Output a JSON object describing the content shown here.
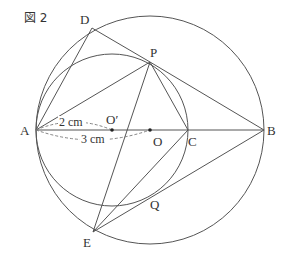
{
  "figure": {
    "title": "図 2",
    "points": {
      "A": {
        "label": "A",
        "x": 36,
        "y": 130
      },
      "B": {
        "label": "B",
        "x": 264,
        "y": 130
      },
      "C": {
        "label": "C",
        "x": 188,
        "y": 130
      },
      "O": {
        "label": "O",
        "x": 150,
        "y": 130
      },
      "O_prime": {
        "label": "O′",
        "x": 112,
        "y": 130
      },
      "D": {
        "label": "D",
        "x": 92,
        "y": 28
      },
      "P": {
        "label": "P",
        "x": 150,
        "y": 62
      },
      "E": {
        "label": "E",
        "x": 93,
        "y": 232
      },
      "Q": {
        "label": "Q",
        "x": 158,
        "y": 193
      }
    },
    "circles": [
      {
        "name": "large-circle",
        "center": "O",
        "radius": 114
      },
      {
        "name": "small-circle",
        "center": "O_prime",
        "radius": 76
      }
    ],
    "segments": [
      [
        "A",
        "B"
      ],
      [
        "A",
        "D"
      ],
      [
        "D",
        "P"
      ],
      [
        "A",
        "P"
      ],
      [
        "P",
        "B"
      ],
      [
        "P",
        "C"
      ],
      [
        "P",
        "E"
      ],
      [
        "E",
        "C"
      ],
      [
        "E",
        "B"
      ]
    ],
    "dimensions": [
      {
        "label": "2 cm",
        "from": "A",
        "to": "O_prime"
      },
      {
        "label": "3 cm",
        "from": "A",
        "to": "O"
      }
    ],
    "colors": {
      "line": "#555555",
      "text": "#333333",
      "background": "#ffffff"
    }
  }
}
